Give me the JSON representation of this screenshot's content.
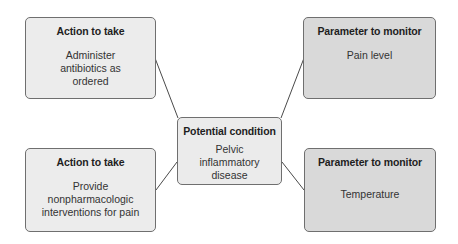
{
  "diagram": {
    "center": {
      "title": "Potential condition",
      "text": "Pelvic inflammatory disease"
    },
    "boxes": [
      {
        "position": "top-left",
        "title": "Action to take",
        "text": "Administer antibiotics as ordered",
        "fill": "#ececec"
      },
      {
        "position": "top-right",
        "title": "Parameter to monitor",
        "text": "Pain level",
        "fill": "#d9d9d9"
      },
      {
        "position": "bottom-left",
        "title": "Action to take",
        "text": "Provide nonpharmacologic interventions for pain",
        "fill": "#ececec"
      },
      {
        "position": "bottom-right",
        "title": "Parameter to monitor",
        "text": "Temperature",
        "fill": "#d9d9d9"
      }
    ],
    "colors": {
      "border": "#6f6f6f",
      "line": "#4a4a4a",
      "background": "#ffffff"
    }
  }
}
